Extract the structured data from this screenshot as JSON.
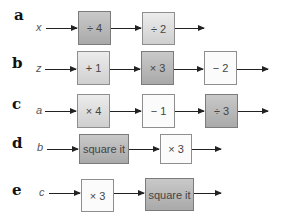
{
  "rows": [
    {
      "label": "a",
      "variable": "x",
      "boxes": [
        {
          "text": "÷ 4",
          "shade": "dark"
        },
        {
          "text": "÷ 2",
          "shade": "mid"
        }
      ]
    },
    {
      "label": "b",
      "variable": "z",
      "boxes": [
        {
          "text": "+ 1",
          "shade": "mid"
        },
        {
          "text": "× 3",
          "shade": "dark"
        },
        {
          "text": "− 2",
          "shade": "light"
        }
      ]
    },
    {
      "label": "c",
      "variable": "a",
      "boxes": [
        {
          "text": "× 4",
          "shade": "mid"
        },
        {
          "text": "− 1",
          "shade": "light"
        },
        {
          "text": "÷ 3",
          "shade": "dark"
        }
      ]
    },
    {
      "label": "d",
      "variable": "b",
      "boxes": [
        {
          "text": "square it",
          "shade": "dark"
        },
        {
          "text": "× 3",
          "shade": "light"
        }
      ]
    },
    {
      "label": "e",
      "variable": "c",
      "boxes": [
        {
          "text": "× 3",
          "shade": "light"
        },
        {
          "text": "square it",
          "shade": "dark"
        }
      ]
    }
  ]
}
